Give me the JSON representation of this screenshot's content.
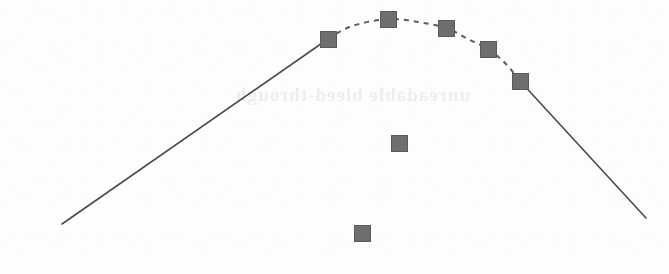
{
  "figure": {
    "title": "",
    "background_color": "#fdfdfd",
    "ghost_text": "unreadable bleed-through",
    "width": 669,
    "height": 274
  },
  "style": {
    "marker_fill": "#6e6e6e",
    "marker_stroke": "#5a5a5a",
    "line_color": "#4a4a4a",
    "dash_color": "#5c5c5c",
    "line_width": 1.6,
    "dash_width": 2.0,
    "marker_size": 16
  },
  "chart_data": {
    "type": "line",
    "title": "",
    "subtitle": "",
    "xlabel": "",
    "ylabel": "",
    "xlim": [
      0,
      669
    ],
    "ylim": [
      274,
      0
    ],
    "grid": false,
    "axes_visible": false,
    "tick_labels_x": [],
    "tick_labels_y": [],
    "legend": [],
    "legend_position": "none",
    "annotations": [],
    "series": [
      {
        "name": "rising-solid-segment",
        "style": "solid",
        "color": "#4a4a4a",
        "markers": false,
        "points": [
          {
            "x": 62,
            "y": 224
          },
          {
            "x": 328,
            "y": 39
          }
        ]
      },
      {
        "name": "peak-dashed-segment",
        "style": "dashed",
        "color": "#5c5c5c",
        "markers": true,
        "points": [
          {
            "x": 328,
            "y": 39
          },
          {
            "x": 352,
            "y": 26
          },
          {
            "x": 388,
            "y": 19
          },
          {
            "x": 418,
            "y": 22
          },
          {
            "x": 446,
            "y": 28
          },
          {
            "x": 468,
            "y": 39
          },
          {
            "x": 488,
            "y": 49
          },
          {
            "x": 505,
            "y": 63
          },
          {
            "x": 520,
            "y": 81
          }
        ]
      },
      {
        "name": "falling-solid-segment",
        "style": "solid",
        "color": "#4a4a4a",
        "markers": false,
        "points": [
          {
            "x": 520,
            "y": 81
          },
          {
            "x": 646,
            "y": 218
          }
        ]
      }
    ],
    "marker_points": [
      {
        "label": "m1",
        "x": 328,
        "y": 39,
        "on_curve": true
      },
      {
        "label": "m2",
        "x": 388,
        "y": 19,
        "on_curve": true
      },
      {
        "label": "m3",
        "x": 446,
        "y": 28,
        "on_curve": true
      },
      {
        "label": "m4",
        "x": 488,
        "y": 49,
        "on_curve": true
      },
      {
        "label": "m5",
        "x": 520,
        "y": 81,
        "on_curve": true
      },
      {
        "label": "m6",
        "x": 399,
        "y": 143,
        "on_curve": false
      },
      {
        "label": "m7",
        "x": 362,
        "y": 233,
        "on_curve": false
      }
    ]
  }
}
